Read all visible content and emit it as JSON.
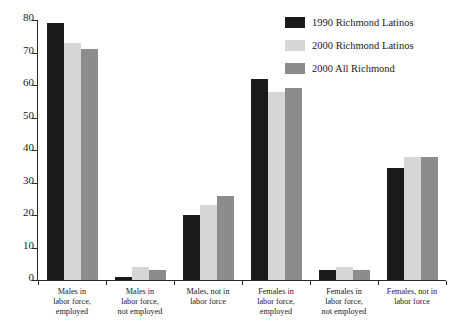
{
  "chart_data": {
    "type": "bar",
    "title": "",
    "subtitle": "",
    "xlabel": "",
    "ylabel": "",
    "ylim": [
      0,
      80
    ],
    "ytick_labels": [
      "0",
      "10",
      "20",
      "30",
      "40",
      "50",
      "60",
      "70",
      "80"
    ],
    "ytick_values": [
      0,
      10,
      20,
      30,
      40,
      50,
      60,
      70,
      80
    ],
    "grid": false,
    "legend_position": "top-right",
    "categories": [
      "Males in labor force, employed",
      "Males in labor force, not employed",
      "Males, not in labor force",
      "Females in labor force, employed",
      "Females in labor force, not employed",
      "Females, not in labor force"
    ],
    "category_lines": [
      [
        "Males in",
        "labor force,",
        "employed"
      ],
      [
        "Males in",
        "labor force,",
        "not employed"
      ],
      [
        "Males, not in",
        "labor force"
      ],
      [
        "Females in",
        "labor force,",
        "employed"
      ],
      [
        "Females in",
        "labor force,",
        "not employed"
      ],
      [
        "Females, not in",
        "labor force"
      ]
    ],
    "series": [
      {
        "name": "1990 Richmond Latinos",
        "color": "#1a1a1a",
        "values": [
          79,
          1,
          20,
          62,
          3,
          34.5
        ]
      },
      {
        "name": "2000 Richmond Latinos",
        "color": "#d6d6d6",
        "values": [
          73,
          4,
          23,
          58,
          4,
          38
        ]
      },
      {
        "name": "2000 All Richmond",
        "color": "#8c8c8c",
        "values": [
          71,
          3,
          26,
          59,
          3,
          38
        ]
      }
    ]
  },
  "legend": {
    "items": [
      {
        "label": "1990 Richmond Latinos",
        "color": "#1a1a1a"
      },
      {
        "label": "2000 Richmond Latinos",
        "color": "#d6d6d6"
      },
      {
        "label": "2000 All Richmond",
        "color": "#8c8c8c"
      }
    ]
  }
}
